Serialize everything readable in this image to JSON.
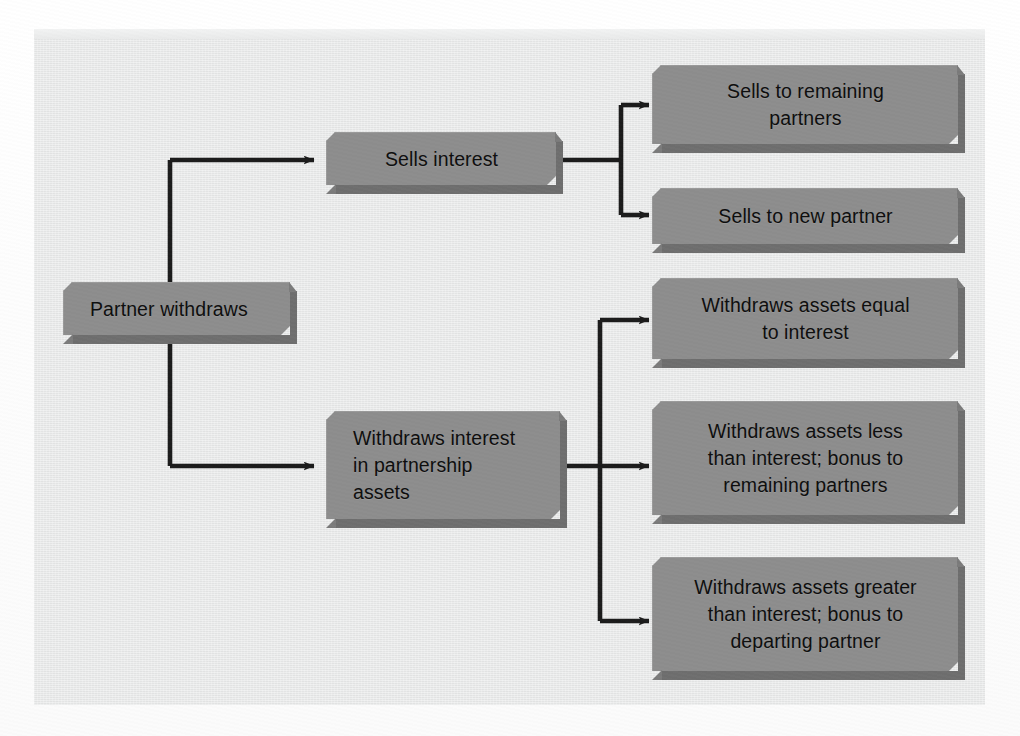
{
  "document": {
    "kind": "scanned-textbook-page",
    "panel_background_color": "#e9eaea",
    "page_background_color": "#ffffff"
  },
  "diagram": {
    "type": "flowchart",
    "title": "",
    "box_fill_color": "#8d8d8d",
    "box_shadow_color": "#6e6e6e",
    "connector_color": "#1b1b1b",
    "label_color": "#0d0d0d",
    "nodes": [
      {
        "id": "root",
        "label": "Partner withdraws",
        "align": "left"
      },
      {
        "id": "sells",
        "label": "Sells interest",
        "align": "center"
      },
      {
        "id": "sells-remaining",
        "label": "Sells to remaining\npartners",
        "align": "center"
      },
      {
        "id": "sells-new",
        "label": "Sells to new partner",
        "align": "center"
      },
      {
        "id": "withdraws",
        "label": "Withdraws interest\nin partnership\nassets",
        "align": "left"
      },
      {
        "id": "assets-equal",
        "label": "Withdraws assets equal\nto interest",
        "align": "center"
      },
      {
        "id": "assets-less",
        "label": "Withdraws assets less\nthan interest; bonus to\nremaining partners",
        "align": "center"
      },
      {
        "id": "assets-greater",
        "label": "Withdraws assets greater\nthan interest; bonus to\ndeparting partner",
        "align": "center"
      }
    ],
    "edges": [
      {
        "from": "root",
        "to": "sells"
      },
      {
        "from": "root",
        "to": "withdraws"
      },
      {
        "from": "sells",
        "to": "sells-remaining"
      },
      {
        "from": "sells",
        "to": "sells-new"
      },
      {
        "from": "withdraws",
        "to": "assets-equal"
      },
      {
        "from": "withdraws",
        "to": "assets-less"
      },
      {
        "from": "withdraws",
        "to": "assets-greater"
      }
    ]
  },
  "background_text": {
    "note": "faint show-through text from the printed book page behind the figure",
    "lines": [
      {
        "text": "MOST is written regarding future",
        "x": 505,
        "y": 36,
        "size": 17,
        "bold": false
      },
      {
        "text": "artner balance is the larger than the Partner is",
        "x": 195,
        "y": 58,
        "size": 17,
        "bold": false
      },
      {
        "text": "remaining partners in balance in their capital",
        "x": 195,
        "y": 82,
        "size": 17,
        "bold": false
      },
      {
        "text": "accounts the same as the following with",
        "x": 205,
        "y": 106,
        "size": 17,
        "bold": false
      },
      {
        "text": "receiving a bonus. The withdrawal above, also",
        "x": 195,
        "y": 152,
        "size": 17,
        "bold": false
      },
      {
        "text": "leaving partner. Investments in some important",
        "x": 195,
        "y": 176,
        "size": 17,
        "bold": false
      },
      {
        "text": "should be made arrangements to the partner",
        "x": 205,
        "y": 200,
        "size": 17,
        "bold": false
      },
      {
        "text": "Death of a Partner",
        "x": 400,
        "y": 278,
        "size": 29,
        "bold": true
      },
      {
        "text": "When a partner dies, the partnership is dissolved",
        "x": 70,
        "y": 334,
        "size": 17,
        "bold": false
      },
      {
        "text": "Conditions of the business remain in",
        "x": 160,
        "y": 358,
        "size": 17,
        "bold": false
      },
      {
        "text": "the closed at interest rates",
        "x": 405,
        "y": 382,
        "size": 17,
        "bold": false
      },
      {
        "text": "through",
        "x": 700,
        "y": 406,
        "size": 17,
        "bold": false
      },
      {
        "text": "account may also be",
        "x": 470,
        "y": 430,
        "size": 17,
        "bold": false
      },
      {
        "text": "balance sheet and a bonus to",
        "x": 400,
        "y": 454,
        "size": 17,
        "bold": false
      },
      {
        "text": "valuing with the new partners. Unless the",
        "x": 240,
        "y": 478,
        "size": 17,
        "bold": false
      },
      {
        "text": "the deceased partner to continues the",
        "x": 230,
        "y": 502,
        "size": 17,
        "bold": false
      },
      {
        "text": "the reverse of the departure side partner.",
        "x": 245,
        "y": 526,
        "size": 17,
        "bold": false
      }
    ]
  }
}
